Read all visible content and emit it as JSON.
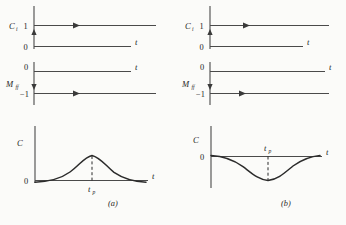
{
  "figure": {
    "type": "multi-panel-signal-diagram",
    "background_color": "#fbfbf9",
    "line_color": "#2b2b2b",
    "panels": [
      {
        "caption": "(a)",
        "plots": [
          {
            "name": "ci-plot",
            "ylabel": "C",
            "ylabel_sub": "i",
            "xlabel": "t",
            "ytick_high": "1",
            "ytick_low": "0",
            "signal": "step-up",
            "level_value": 1,
            "arrow_direction": "right",
            "transition_arrow": "up"
          },
          {
            "name": "mff-plot",
            "ylabel": "M",
            "ylabel_sub": "ff",
            "xlabel": "t",
            "ytick_high": "0",
            "ytick_low": "−1",
            "signal": "step-down",
            "level_value": -1,
            "arrow_direction": "right",
            "transition_arrow": "down"
          },
          {
            "name": "c-plot",
            "ylabel": "C",
            "xlabel": "t",
            "ytick": "0",
            "ytick_position": "below-axis",
            "signal": "positive-bump",
            "peak_label": "t",
            "peak_label_sub": "p",
            "peak_label_position": "below-axis"
          }
        ]
      },
      {
        "caption": "(b)",
        "plots": [
          {
            "name": "ci-plot",
            "ylabel": "C",
            "ylabel_sub": "i",
            "xlabel": "t",
            "ytick_high": "1",
            "ytick_low": "0",
            "signal": "step-up",
            "level_value": 1,
            "arrow_direction": "right",
            "transition_arrow": "up"
          },
          {
            "name": "mff-plot",
            "ylabel": "M",
            "ylabel_sub": "ff",
            "xlabel": "t",
            "ytick_high": "0",
            "ytick_low": "−1",
            "signal": "step-down",
            "level_value": -1,
            "arrow_direction": "right",
            "transition_arrow": "down"
          },
          {
            "name": "c-plot",
            "ylabel": "C",
            "xlabel": "t",
            "ytick": "0",
            "ytick_position": "on-axis",
            "signal": "negative-dip",
            "peak_label": "t",
            "peak_label_sub": "p",
            "peak_label_position": "above-axis"
          }
        ]
      }
    ]
  }
}
